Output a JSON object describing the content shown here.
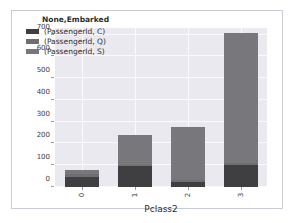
{
  "chart_data": {
    "type": "bar",
    "title": "",
    "subtitle": "",
    "xlabel": "Pclass2",
    "ylabel": "",
    "categories": [
      "0",
      "1",
      "2",
      "3"
    ],
    "xtick_labels": [
      "0",
      "1",
      "2",
      "3"
    ],
    "ytick_labels": [
      "0",
      "100",
      "200",
      "300",
      "400",
      "500",
      "600",
      "700"
    ],
    "ylim": [
      0,
      730
    ],
    "yticks": [
      0,
      100,
      200,
      300,
      400,
      500,
      600,
      700
    ],
    "grid": true,
    "stacked": true,
    "legend_position": "upper left",
    "legend_title": "None,Embarked",
    "series": [
      {
        "name": "(PassengerId, C)",
        "color": "#3f3f42",
        "values": [
          45,
          95,
          25,
          100
        ]
      },
      {
        "name": "(PassengerId, Q)",
        "color": "#6e6e73",
        "values": [
          15,
          5,
          5,
          10
        ]
      },
      {
        "name": "(PassengerId, S)",
        "color": "#77777c",
        "values": [
          20,
          140,
          245,
          595
        ]
      }
    ],
    "totals": [
      80,
      240,
      275,
      705
    ],
    "plot_background": "#e9e9ef",
    "gridline_color": "#fafafc",
    "figure_background": "#ffffff",
    "frame_border_color": "#c9ccd4"
  },
  "legend": {
    "title": "None,Embarked",
    "entries": [
      {
        "label": "(PassengerId, C)",
        "color": "#3f3f42"
      },
      {
        "label": "(PassengerId, Q)",
        "color": "#6e6e73"
      },
      {
        "label": "(PassengerId, S)",
        "color": "#77777c"
      }
    ]
  },
  "axes": {
    "xlabel": "Pclass2",
    "ytick_0": "0",
    "ytick_1": "100",
    "ytick_2": "200",
    "ytick_3": "300",
    "ytick_4": "400",
    "ytick_5": "500",
    "ytick_6": "600",
    "ytick_7": "700",
    "xtick_0": "0",
    "xtick_1": "1",
    "xtick_2": "2",
    "xtick_3": "3"
  }
}
